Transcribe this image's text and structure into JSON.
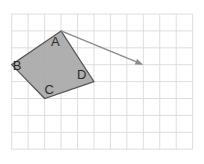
{
  "diagram": {
    "type": "grid-translation",
    "grid": {
      "columns": 11,
      "rows": 8,
      "origin_px": [
        11.7,
        14
      ],
      "cell_w": 16.45,
      "cell_h": 16.9,
      "line_color": "#dedede"
    },
    "shape": {
      "fill": "#a8a8a8",
      "stroke": "#555555",
      "vertices": [
        {
          "label": "A",
          "grid": [
            3,
            1
          ],
          "label_offset": [
            -10,
            15
          ]
        },
        {
          "label": "B",
          "grid": [
            0,
            3
          ],
          "label_offset": [
            1,
            5
          ]
        },
        {
          "label": "C",
          "grid": [
            2,
            5
          ],
          "label_offset": [
            0,
            -5
          ]
        },
        {
          "label": "D",
          "grid": [
            5,
            4
          ],
          "label_offset": [
            -17,
            -3
          ]
        }
      ]
    },
    "vector": {
      "from_grid": [
        3,
        1
      ],
      "to_grid": [
        8,
        3
      ],
      "color": "#8a8a8a"
    }
  }
}
